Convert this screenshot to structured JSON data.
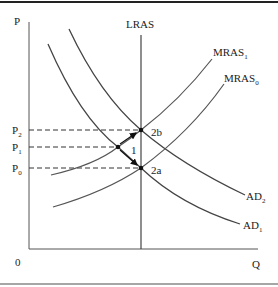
{
  "diagram": {
    "type": "AD-AS macroeconomic diagram",
    "axes": {
      "y_label": "P",
      "x_label": "Q",
      "origin_label": "0"
    },
    "curves": [
      {
        "id": "LRAS",
        "label": "LRAS",
        "sub": ""
      },
      {
        "id": "MRAS1",
        "label": "MRAS",
        "sub": "1"
      },
      {
        "id": "MRAS0",
        "label": "MRAS",
        "sub": "0"
      },
      {
        "id": "AD2",
        "label": "AD",
        "sub": "2"
      },
      {
        "id": "AD1",
        "label": "AD",
        "sub": "1"
      }
    ],
    "price_levels": [
      {
        "label": "P",
        "sub": "2"
      },
      {
        "label": "P",
        "sub": "1"
      },
      {
        "label": "P",
        "sub": "0"
      }
    ],
    "points": [
      {
        "label": "2b"
      },
      {
        "label": "1"
      },
      {
        "label": "2a"
      }
    ],
    "colors": {
      "line": "#333333",
      "axis": "#555555",
      "border": "#222222"
    }
  }
}
